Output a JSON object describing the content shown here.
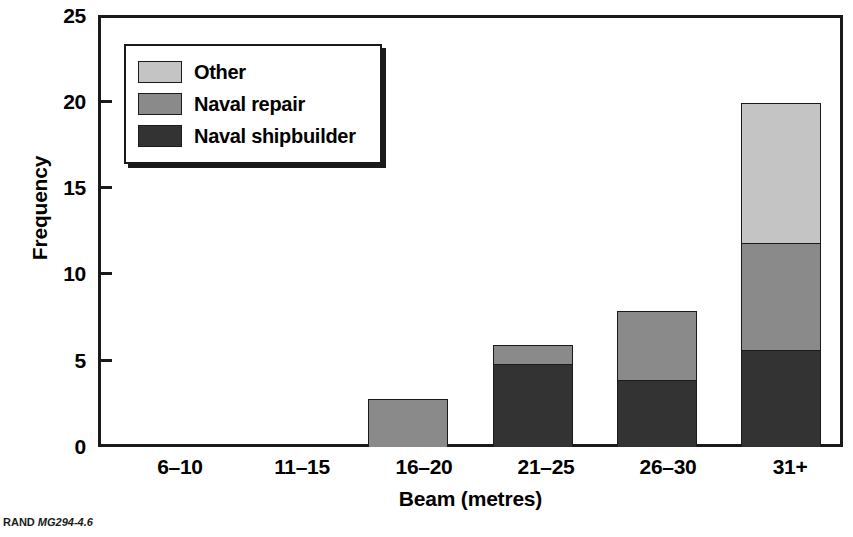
{
  "figure": {
    "footer_prefix": "RAND",
    "footer_id": "MG294-4.6"
  },
  "chart_data": {
    "type": "bar",
    "subtype": "stacked-vertical",
    "title": "",
    "xlabel": "Beam (metres)",
    "ylabel": "Frequency",
    "categories": [
      "6–10",
      "11–15",
      "16–20",
      "21–25",
      "26–30",
      "31+"
    ],
    "series": [
      {
        "name": "Naval shipbuilder",
        "color": "#333333",
        "values": [
          0,
          0,
          0,
          4.8,
          3.9,
          5.6
        ]
      },
      {
        "name": "Naval repair",
        "color": "#8a8a8a",
        "values": [
          0,
          0,
          2.8,
          1.1,
          4.0,
          6.2
        ]
      },
      {
        "name": "Other",
        "color": "#c4c4c4",
        "values": [
          0,
          0,
          0,
          0,
          0,
          8.1
        ]
      }
    ],
    "totals": [
      0,
      0,
      2.8,
      5.9,
      7.9,
      19.9
    ],
    "ylim": [
      0,
      25
    ],
    "yticks": [
      0,
      5,
      10,
      15,
      20,
      25
    ],
    "ytick_labels": [
      "0",
      "5",
      "10",
      "15",
      "20",
      "25"
    ],
    "grid": false,
    "legend_position": "upper-left-inside",
    "legend_entries": [
      "Other",
      "Naval repair",
      "Naval shipbuilder"
    ],
    "axis_color": "#1a1a1a"
  }
}
